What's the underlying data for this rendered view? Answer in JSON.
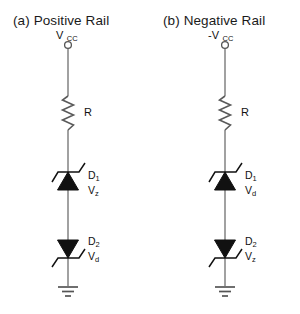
{
  "figure": {
    "background_color": "#ffffff",
    "wire_color": "#808080",
    "symbol_color": "#111111",
    "text_color": "#1a1a1a"
  },
  "panels": [
    {
      "id": "panel-a",
      "title": "(a) Positive Rail",
      "supply": {
        "label_main": "V",
        "label_sub": "CC",
        "full": "VCC",
        "terminal_icon": "open-circle-terminal"
      },
      "resistor": {
        "label": "R",
        "symbol": "zigzag-resistor"
      },
      "diodes": [
        {
          "ref": "D",
          "ref_sub": "1",
          "voltage": "V",
          "voltage_sub": "z",
          "orientation": "up",
          "symbol": "zener-diode"
        },
        {
          "ref": "D",
          "ref_sub": "2",
          "voltage": "V",
          "voltage_sub": "d",
          "orientation": "down",
          "symbol": "zener-diode"
        }
      ],
      "ground": {
        "symbol": "earth-ground",
        "bars": 3
      }
    },
    {
      "id": "panel-b",
      "title": "(b) Negative Rail",
      "supply": {
        "label_main": "-V",
        "label_sub": "CC",
        "full": "-VCC",
        "terminal_icon": "open-circle-terminal"
      },
      "resistor": {
        "label": "R",
        "symbol": "zigzag-resistor"
      },
      "diodes": [
        {
          "ref": "D",
          "ref_sub": "1",
          "voltage": "V",
          "voltage_sub": "d",
          "orientation": "up",
          "symbol": "zener-diode"
        },
        {
          "ref": "D",
          "ref_sub": "2",
          "voltage": "V",
          "voltage_sub": "z",
          "orientation": "down",
          "symbol": "zener-diode"
        }
      ],
      "ground": {
        "symbol": "earth-ground",
        "bars": 3
      }
    }
  ]
}
